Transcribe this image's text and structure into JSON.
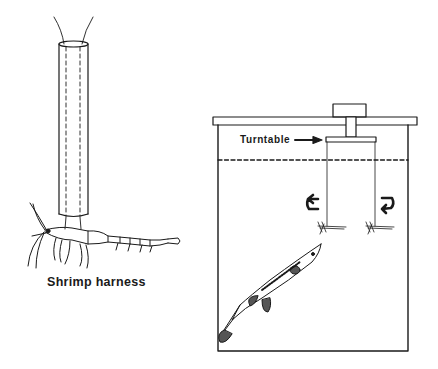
{
  "figure": {
    "panels": [
      {
        "id": "shrimp-harness",
        "caption": "Shrimp harness",
        "elements": [
          "tube",
          "threads",
          "shrimp"
        ]
      },
      {
        "id": "tank-apparatus",
        "labels": {
          "turntable": "Turntable"
        },
        "elements": [
          "tank",
          "lid",
          "knob",
          "shaft",
          "turntable",
          "water-line",
          "tethered-shrimp-left",
          "tethered-shrimp-right",
          "rotation-arrow-left",
          "rotation-arrow-right",
          "stickleback-fish"
        ]
      }
    ],
    "colors": {
      "ink": "#1a1a1a",
      "background": "#ffffff"
    }
  }
}
